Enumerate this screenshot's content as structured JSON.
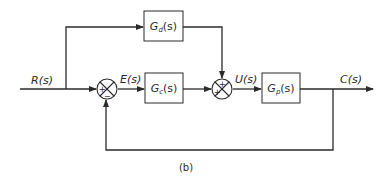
{
  "diagram": {
    "type": "block-diagram",
    "caption": "(b)",
    "signals": {
      "input": "R(s)",
      "error": "E(s)",
      "control": "U(s)",
      "output": "C(s)"
    },
    "blocks": [
      {
        "id": "gd",
        "base": "G",
        "sub": "d",
        "tail": "(s)"
      },
      {
        "id": "gc",
        "base": "G",
        "sub": "c",
        "tail": "(s)"
      },
      {
        "id": "gp",
        "base": "G",
        "sub": "p",
        "tail": "(s)"
      }
    ],
    "summing_junctions": [
      {
        "id": "sum1",
        "signs": {
          "left": "+",
          "bottom": "−"
        }
      },
      {
        "id": "sum2",
        "signs": {
          "left": "+",
          "top": "+"
        }
      }
    ],
    "colors": {
      "line": "#2a2a2a",
      "background": "#ffffff"
    }
  }
}
